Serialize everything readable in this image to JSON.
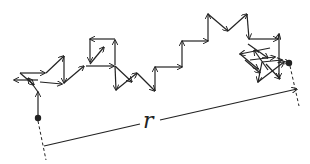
{
  "diagram": {
    "distance_label": "r",
    "colors": {
      "stroke": "#222222",
      "background": "#ffffff"
    },
    "start_point": {
      "x": 38,
      "y": 118
    },
    "end_point": {
      "x": 289,
      "y": 63
    },
    "displacement_line": {
      "x1": 44,
      "y1": 146,
      "x2": 297,
      "y2": 89
    },
    "label_position": {
      "x": 143,
      "y": 113
    }
  }
}
